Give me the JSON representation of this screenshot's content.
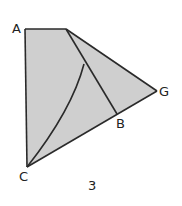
{
  "figure": {
    "caption": "3",
    "labels": {
      "A": "A",
      "G": "G",
      "B": "B",
      "C": "C"
    },
    "fill_color": "#cfcfcf",
    "stroke_color": "#2a2a2a"
  }
}
